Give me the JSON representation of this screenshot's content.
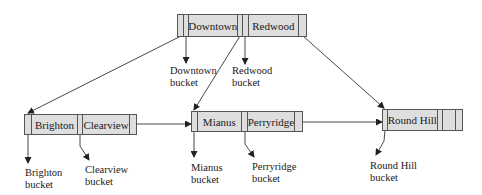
{
  "diagram": {
    "type": "B+-tree",
    "root": {
      "keys": [
        "Downtown",
        "Redwood"
      ]
    },
    "leaves": [
      {
        "keys": [
          "Brighton",
          "Clearview"
        ]
      },
      {
        "keys": [
          "Mianus",
          "Perryridge"
        ]
      },
      {
        "keys": [
          "Round Hill"
        ]
      }
    ],
    "buckets": [
      {
        "line1": "Downtown",
        "line2": "bucket"
      },
      {
        "line1": "Redwood",
        "line2": "bucket"
      },
      {
        "line1": "Brighton",
        "line2": "bucket"
      },
      {
        "line1": "Clearview",
        "line2": "bucket"
      },
      {
        "line1": "Mianus",
        "line2": "bucket"
      },
      {
        "line1": "Perryridge",
        "line2": "bucket"
      },
      {
        "line1": "Round Hill",
        "line2": "bucket"
      }
    ]
  }
}
